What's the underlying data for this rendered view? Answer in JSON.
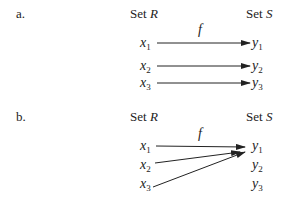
{
  "diagrams": [
    {
      "label": "a.",
      "domain_title": "Set",
      "domain_name": "R",
      "codomain_title": "Set",
      "codomain_name": "S",
      "function_name": "f",
      "domain": [
        {
          "base": "x",
          "sub": "1"
        },
        {
          "base": "x",
          "sub": "2"
        },
        {
          "base": "x",
          "sub": "3"
        }
      ],
      "codomain": [
        {
          "base": "y",
          "sub": "1"
        },
        {
          "base": "y",
          "sub": "2"
        },
        {
          "base": "y",
          "sub": "3"
        }
      ],
      "mappings": [
        [
          "x1",
          "y1"
        ],
        [
          "x2",
          "y2"
        ],
        [
          "x3",
          "y3"
        ]
      ]
    },
    {
      "label": "b.",
      "domain_title": "Set",
      "domain_name": "R",
      "codomain_title": "Set",
      "codomain_name": "S",
      "function_name": "f",
      "domain": [
        {
          "base": "x",
          "sub": "1"
        },
        {
          "base": "x",
          "sub": "2"
        },
        {
          "base": "x",
          "sub": "3"
        }
      ],
      "codomain": [
        {
          "base": "y",
          "sub": "1"
        },
        {
          "base": "y",
          "sub": "2"
        },
        {
          "base": "y",
          "sub": "3"
        }
      ],
      "mappings": [
        [
          "x1",
          "y1"
        ],
        [
          "x2",
          "y1"
        ],
        [
          "x3",
          "y1"
        ]
      ]
    }
  ]
}
